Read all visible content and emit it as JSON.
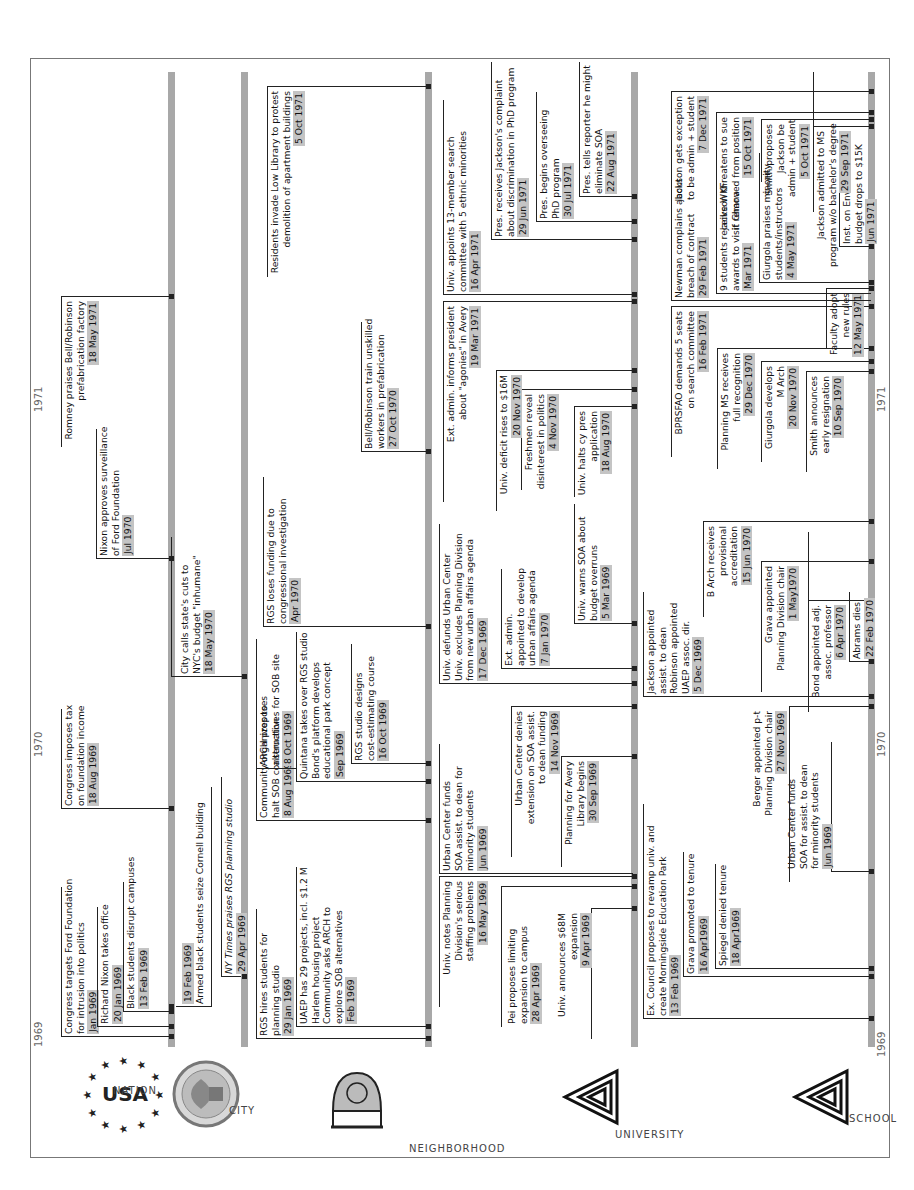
{
  "years": [
    {
      "label": "1969"
    },
    {
      "label": "1970"
    },
    {
      "label": "1971"
    }
  ],
  "lanes": [
    {
      "id": "nation",
      "label": "NATION",
      "logo": "usa-stars-logo"
    },
    {
      "id": "city",
      "label": "CITY",
      "logo": "nyc-seal-logo"
    },
    {
      "id": "neighborhood",
      "label": "NEIGHBORHOOD",
      "logo": "neighborhood-arch-logo"
    },
    {
      "id": "university",
      "label": "UNIVERSITY",
      "logo": "triangle-spiral-logo"
    },
    {
      "id": "school",
      "label": "SCHOOL",
      "logo": "triangle-spiral-logo"
    }
  ],
  "events": {
    "nation": [
      {
        "lines": [
          "Congress targets Ford Foundation",
          "for intrusion into politics"
        ],
        "date": "Jan 1969"
      },
      {
        "lines": [
          "Richard Nixon takes office"
        ],
        "date": "20 Jan 1969"
      },
      {
        "lines": [
          "Black students disrupt campuses"
        ],
        "date": "13 Feb 1969"
      },
      {
        "lines": [
          "Congress imposes tax",
          "on foundation income"
        ],
        "date": "18 Aug 1969"
      },
      {
        "lines": [
          "Nixon approves surveillance",
          "of Ford Foundation"
        ],
        "date": "Jul 1970"
      },
      {
        "lines": [
          "Romney praises Bell/Robinson",
          "prefabrication factory"
        ],
        "date": "18 May 1971"
      },
      {
        "lines": [
          "Armed black students seize Cornell building"
        ],
        "date": "19 Feb 1969"
      },
      {
        "lines": [
          "NY Times praises RGS planning studio"
        ],
        "date": "29 Apr 1969"
      }
    ],
    "city": [
      {
        "lines": [
          "City calls state's cuts to",
          "NYC's budget \"inhumane\""
        ],
        "date": "18 May 1970"
      },
      {
        "lines": [
          "RGS hires students for",
          "planning studio"
        ],
        "date": "29 Jan 1969"
      },
      {
        "lines": [
          "UAEP has 29 projects, incl. $1.2 M",
          "Harlem housing project",
          "Community asks ARCH to",
          "explore SOB alternatives"
        ],
        "date": "Feb 1969"
      },
      {
        "lines": [
          "Community organizes to",
          "halt SOB construction"
        ],
        "date": "8 Aug 1969"
      },
      {
        "lines": [
          "Quintana takes over RGS studio",
          "Bond's platform develops",
          "educational park concept"
        ],
        "date": "Sep 1969"
      },
      {
        "lines": [
          "ARCH proposes",
          "alternatives for SOB site"
        ],
        "date": "8 Oct 1969"
      },
      {
        "lines": [
          "RGS studio designs",
          "cost-estimating course"
        ],
        "date": "16 Oct 1969"
      },
      {
        "lines": [
          "RGS loses funding  due to",
          "congressional investigation"
        ],
        "date": "Apr 1970"
      },
      {
        "lines": [
          "Bell/Robinson train unskilled",
          "workers in prefabrication"
        ],
        "date": "27 Oct 1970"
      },
      {
        "lines": [
          "Residents invade Low Library to protest",
          "demolition of apartment buildings"
        ],
        "date": "5 Oct 1971"
      }
    ],
    "neighborhood": [
      {
        "lines": [
          "Univ. announces $68M",
          "expansion"
        ],
        "date": "9 Apr 1969"
      },
      {
        "lines": [
          "Pei proposes limiting",
          "expansion to campus"
        ],
        "date": "28 Apr 1969"
      },
      {
        "lines": [
          "Univ. notes Planning",
          "Division's serious",
          "staffing problems"
        ],
        "date": "16 May 1969"
      },
      {
        "lines": [
          "Urban Center funds",
          "SOA assist. to dean for",
          "minority students"
        ],
        "date": "Jun 1969"
      },
      {
        "lines": [
          "Planning for Avery",
          "Library begins"
        ],
        "date": "30 Sep 1969"
      },
      {
        "lines": [
          "Urban Center denies",
          "extension on SOA assist.",
          "to dean funding"
        ],
        "date": "14 Nov 1969"
      },
      {
        "lines": [
          "Univ. defunds Urban Center",
          "Univ. excludes Planning Division",
          "from new urban affairs agenda"
        ],
        "date": "17 Dec 1969"
      },
      {
        "lines": [
          "Ext. admin.",
          "appointed to develop",
          "urban affairs agenda"
        ],
        "date": "7 Jan 1970"
      },
      {
        "lines": [
          "Univ. warns SOA about",
          "budget overruns"
        ],
        "date": "5 Mar 1969"
      },
      {
        "lines": [
          "Univ. halts cy pres",
          "application"
        ],
        "date": "18 Aug 1970"
      },
      {
        "lines": [
          "Freshmen reveal",
          "disinterest in politics"
        ],
        "date": "4 Nov 1970"
      },
      {
        "lines": [
          "Univ. deficit rises to $16M"
        ],
        "date": "20 Nov 1970"
      },
      {
        "lines": [
          "Ext. admin. informs president",
          "about \"agonies\" in Avery"
        ],
        "date": "19 Mar 1971"
      },
      {
        "lines": [
          "Univ. appoints 13-member search",
          "committee with 5 ethnic minorities"
        ],
        "date": "16 Apr 1971"
      },
      {
        "lines": [
          "Pres. receives Jackson's complaint",
          "about discrimination in PhD program"
        ],
        "date": "29 Jun 1971"
      },
      {
        "lines": [
          "Pres. begins overseeing",
          "PhD program"
        ],
        "date": "30 Jul 1971"
      },
      {
        "lines": [
          "Pres. tells reporter he might",
          "eliminate SOA"
        ],
        "date": "22 Aug 1971"
      }
    ],
    "university": [
      {
        "lines": [
          "Ex. Council proposes to revamp univ. and",
          "create Morningside Education Park"
        ],
        "date": "13 Feb 1969"
      },
      {
        "lines": [
          "Grava promoted to tenure"
        ],
        "date": "16 Apr1969"
      },
      {
        "lines": [
          "Spiegel denied tenure"
        ],
        "date": "18 Apr1969"
      },
      {
        "lines": [
          "Urban Center funds",
          "SOA for assist. to dean",
          "for minority students"
        ],
        "date": "Jun 1969"
      },
      {
        "lines": [
          "Berger appointed p-t",
          "Planning Division chair"
        ],
        "date": "27 Nov 1969"
      },
      {
        "lines": [
          "Jackson appointed",
          "assist. to dean",
          "Robinson appointed",
          "UAEP assoc. dir."
        ],
        "date": "5 Dec 1969"
      },
      {
        "lines": [
          "Bond appointed adj.",
          "assoc. professor"
        ],
        "date": "6 Apr 1970"
      },
      {
        "lines": [
          "Abrams dies"
        ],
        "date": "22 Feb 1970"
      },
      {
        "lines": [
          "Grava appointed",
          "Planning Division chair"
        ],
        "date": "1 May1970"
      },
      {
        "lines": [
          "B Arch receives",
          "provisional",
          "accreditation"
        ],
        "date": "15 Jun 1970"
      },
      {
        "lines": [
          "Smith announces",
          "early resignation"
        ],
        "date": "10 Sep 1970"
      },
      {
        "lines": [
          "Giurgola develops",
          "M Arch"
        ],
        "date": "20 Nov 1970"
      },
      {
        "lines": [
          "Planning MS receives",
          "full recognition"
        ],
        "date": "29 Dec 1970"
      },
      {
        "lines": [
          "BPRSFAO demands 5 seats",
          "on search committee"
        ],
        "date": "16 Feb 1971"
      },
      {
        "lines": [
          "Faculty adopt",
          "new rules"
        ],
        "date": "12 May 1971"
      },
      {
        "lines": [
          "Newman complains about",
          "breach of contract"
        ],
        "date": "29 Feb 1971"
      },
      {
        "lines": [
          "9 students receive WKF",
          "awards to visit Ghana"
        ],
        "date": "Mar 1971"
      },
      {
        "lines": [
          "Giurgola praises minority",
          "students/instructors"
        ],
        "date": "4 May 1971"
      },
      {
        "lines": [
          "Inst. on Environment",
          "budget drops to $15K"
        ],
        "date": "Jun 1971"
      },
      {
        "lines": [
          "Jackson admitted to MS",
          "program w/o bachelor's degree"
        ],
        "date": "29 Sep 1971"
      },
      {
        "lines": [
          "Smith proposes",
          "Jackson be",
          "admin + student"
        ],
        "date": "5 Oct 1971"
      },
      {
        "lines": [
          "Jackson threatens to sue",
          "if removed from position"
        ],
        "date": "15 Oct 1971"
      },
      {
        "lines": [
          "Jackson gets exception",
          "to be admin + student"
        ],
        "date": "7 Dec 1971"
      }
    ]
  }
}
